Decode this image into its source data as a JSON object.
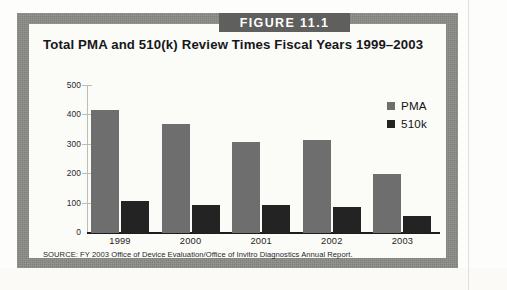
{
  "figure": {
    "banner_label": "FIGURE 11.1",
    "title": "Total PMA and 510(k) Review Times Fiscal Years 1999–2003",
    "source": "SOURCE: FY 2003 Office of Device Evaluation/Office of Invitro Diagnostics Annual Report."
  },
  "colors": {
    "frame": "#8b8b87",
    "banner": "#5f5f5d",
    "pma": "#6e6e6e",
    "k510": "#232323",
    "page": "#fdfdfb"
  },
  "chart_data": {
    "type": "bar",
    "title": "Total PMA and 510(k) Review Times Fiscal Years 1999–2003",
    "xlabel": "",
    "ylabel": "",
    "ylim": [
      0,
      500
    ],
    "yticks": [
      0,
      100,
      200,
      300,
      400,
      500
    ],
    "grid": false,
    "legend_position": "top-right",
    "categories": [
      "1999",
      "2000",
      "2001",
      "2002",
      "2003"
    ],
    "series": [
      {
        "name": "PMA",
        "color": "#6e6e6e",
        "values": [
          420,
          370,
          310,
          318,
          200
        ]
      },
      {
        "name": "510k",
        "color": "#232323",
        "values": [
          108,
          96,
          96,
          87,
          57
        ]
      }
    ]
  }
}
